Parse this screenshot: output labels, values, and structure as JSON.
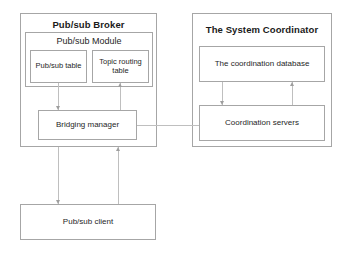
{
  "diagram": {
    "type": "block-architecture",
    "background_color": "#ffffff",
    "border_color": "#a6a6a6",
    "connector_color": "#bfbfbf",
    "text_color": "#262626",
    "containers": [
      {
        "id": "broker",
        "title": "Pub/sub Broker"
      },
      {
        "id": "coordinator",
        "title": "The System Coordinator"
      }
    ],
    "broker": {
      "title": "Pub/sub Broker",
      "module": {
        "title": "Pub/sub Module",
        "tables": [
          {
            "label": "Pub/sub table"
          },
          {
            "label": "Topic routing table"
          }
        ]
      },
      "bridging_manager": {
        "label": "Bridging manager"
      }
    },
    "coordinator": {
      "title": "The System Coordinator",
      "database": {
        "label": "The coordination database"
      },
      "servers": {
        "label": "Coordination servers"
      }
    },
    "client": {
      "label": "Pub/sub client"
    },
    "connectors": [
      {
        "from": "pubsub-table",
        "to": "bridging-manager",
        "direction": "down"
      },
      {
        "from": "bridging-manager",
        "to": "topic-routing-table",
        "direction": "up"
      },
      {
        "from": "bridging-manager",
        "to": "coordination-servers",
        "direction": "horizontal"
      },
      {
        "from": "coordination-database",
        "to": "coordination-servers",
        "direction": "down"
      },
      {
        "from": "coordination-servers",
        "to": "coordination-database",
        "direction": "up"
      },
      {
        "from": "broker",
        "to": "pubsub-client",
        "direction": "down"
      },
      {
        "from": "pubsub-client",
        "to": "broker",
        "direction": "up"
      }
    ]
  }
}
